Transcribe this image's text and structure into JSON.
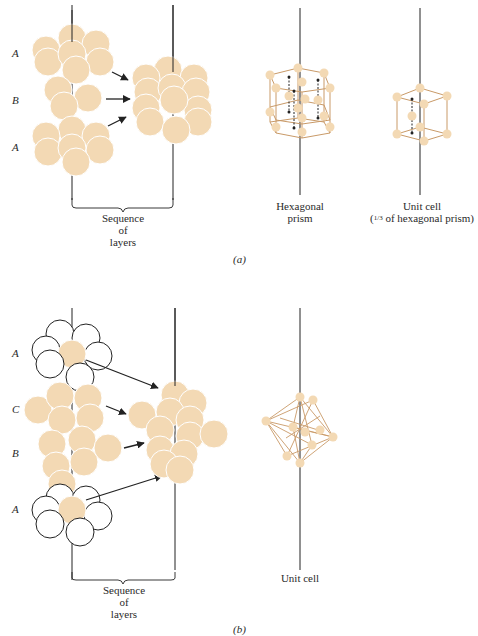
{
  "figure": {
    "colors": {
      "sphere": "#f3d9b4",
      "sphere_edge": "#ffffff",
      "frame": "#c99a68",
      "line": "#222222",
      "open_sphere_fill": "#ffffff"
    },
    "panel_a": {
      "label": "(a)",
      "layer_labels": [
        "A",
        "B",
        "A"
      ],
      "sequence_label": [
        "Sequence",
        "of",
        "layers"
      ],
      "prism_label": [
        "Hexagonal",
        "prism"
      ],
      "unit_cell_label": [
        "Unit cell",
        "(1/3 of hexagonal prism)"
      ],
      "unit_cell_fraction": "1/3",
      "unit_cell_suffix": "of hexagonal prism)"
    },
    "panel_b": {
      "label": "(b)",
      "layer_labels": [
        "A",
        "C",
        "B",
        "A"
      ],
      "sequence_label": [
        "Sequence",
        "of",
        "layers"
      ],
      "unit_cell_label": "Unit cell"
    }
  }
}
